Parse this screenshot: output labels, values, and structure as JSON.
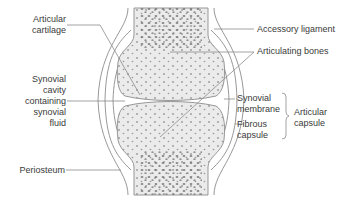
{
  "diagram": {
    "labels": {
      "articular_cartilage": "Articular\ncartilage",
      "synovial_cavity": "Synovial\ncavity\ncontaining\nsynovial\nfluid",
      "periosteum": "Periosteum",
      "accessory_ligament": "Accessory ligament",
      "articulating_bones": "Articulating bones",
      "synovial_membrane": "Synovial\nmembrane",
      "fibrous_capsule": "Fibrous\ncapsule",
      "articular_capsule": "Articular\ncapsule"
    },
    "colors": {
      "bone_fill": "#ebebeb",
      "spongy_dots": "#8a8a8a",
      "outline": "#8c8c8c",
      "leader_line": "#8c8c8c",
      "text": "#3a3a3a",
      "background": "#ffffff"
    }
  }
}
